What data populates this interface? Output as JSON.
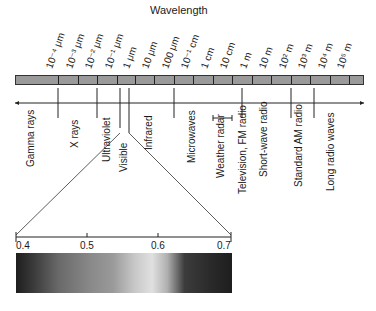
{
  "title": "Wavelength",
  "wavelength_labels": [
    {
      "text": "10⁻⁴ μm",
      "x": 58
    },
    {
      "text": "10⁻³ μm",
      "x": 78
    },
    {
      "text": "10⁻² μm",
      "x": 97
    },
    {
      "text": "10⁻¹ μm",
      "x": 117
    },
    {
      "text": "1 μm",
      "x": 135
    },
    {
      "text": "10 μm",
      "x": 154
    },
    {
      "text": "100 μm",
      "x": 174
    },
    {
      "text": "10⁻¹ cm",
      "x": 193
    },
    {
      "text": "1 cm",
      "x": 213
    },
    {
      "text": "10 cm",
      "x": 232
    },
    {
      "text": "1 m",
      "x": 252
    },
    {
      "text": "10 m",
      "x": 271
    },
    {
      "text": "10² m",
      "x": 291
    },
    {
      "text": "10³ m",
      "x": 310
    },
    {
      "text": "10⁴ m",
      "x": 330
    },
    {
      "text": "10⁵ m",
      "x": 349
    }
  ],
  "bands": [
    {
      "name": "Gamma rays",
      "x": 32
    },
    {
      "name": "X rays",
      "x": 76
    },
    {
      "name": "Ultraviolet",
      "x": 108
    },
    {
      "name": "Visible",
      "x": 125
    },
    {
      "name": "Infrared",
      "x": 150
    },
    {
      "name": "Microwaves",
      "x": 193
    },
    {
      "name": "Weather radar",
      "x": 222
    },
    {
      "name": "Television, FM radio",
      "x": 244
    },
    {
      "name": "Short-wave radio",
      "x": 265
    },
    {
      "name": "Standard AM radio",
      "x": 300
    },
    {
      "name": "Long radio waves",
      "x": 332
    }
  ],
  "visible_axis": {
    "unit": "μm",
    "ticks": [
      {
        "label": "0.4",
        "x": 16
      },
      {
        "label": "0.5",
        "x": 87
      },
      {
        "label": "0.6",
        "x": 158
      },
      {
        "label": "0.7",
        "x": 231
      }
    ]
  }
}
